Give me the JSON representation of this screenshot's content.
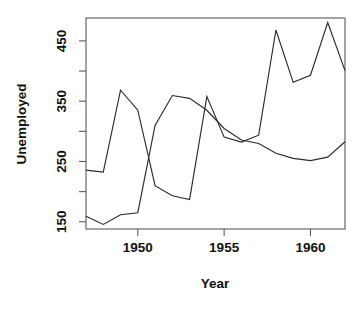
{
  "chart_data": {
    "type": "line",
    "title": "",
    "xlabel": "Year",
    "ylabel": "Unemployed",
    "xlim": [
      1947,
      1962
    ],
    "ylim": [
      138,
      488
    ],
    "grid": false,
    "legend": "none",
    "x": [
      1947,
      1948,
      1949,
      1950,
      1951,
      1952,
      1953,
      1954,
      1955,
      1956,
      1957,
      1958,
      1959,
      1960,
      1961,
      1962
    ],
    "xticks": [
      1950,
      1955,
      1960
    ],
    "xticklabels": [
      "1950",
      "1955",
      "1960"
    ],
    "yticks": [
      150,
      250,
      350,
      450
    ],
    "yticklabels": [
      "150",
      "250",
      "350",
      "450"
    ],
    "yminorticks": [
      200,
      300,
      400
    ],
    "series": [
      {
        "name": "Unemployed",
        "values": [
          235.6,
          232.5,
          368.2,
          335.1,
          209.9,
          193.2,
          187.0,
          357.8,
          290.4,
          282.2,
          293.6,
          468.1,
          381.3,
          393.1,
          480.6,
          400.7
        ]
      },
      {
        "name": "Armed.Forces",
        "values": [
          159.0,
          145.6,
          161.6,
          165.0,
          309.9,
          359.4,
          354.7,
          335.0,
          304.8,
          285.7,
          279.8,
          263.7,
          255.2,
          251.4,
          257.2,
          282.7
        ]
      }
    ]
  },
  "axes": {
    "xlabel": "Year",
    "ylabel": "Unemployed"
  }
}
